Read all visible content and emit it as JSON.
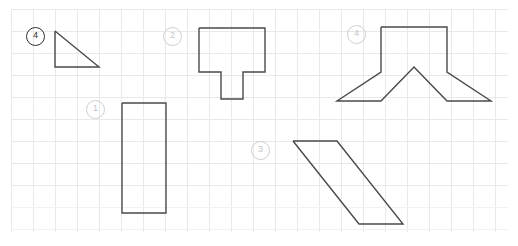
{
  "canvas": {
    "width": 518,
    "height": 246,
    "background_color": "#ffffff",
    "grid_color": "#e9e9ec",
    "grid_spacing": 22,
    "grid_origin_x": 11,
    "grid_origin_y": 9,
    "stroke_color": "#4a4a4a",
    "label_color": "#c3c3c8",
    "label_color_dark": "#2f2f2f"
  },
  "labels": [
    {
      "id": "callout-4-left",
      "text": "4",
      "x": 26,
      "y": 27,
      "style": "dark"
    },
    {
      "id": "callout-2",
      "text": "2",
      "x": 163,
      "y": 27,
      "style": "light"
    },
    {
      "id": "callout-1",
      "text": "1",
      "x": 86,
      "y": 100,
      "style": "light"
    },
    {
      "id": "callout-3",
      "text": "3",
      "x": 251,
      "y": 141,
      "style": "light"
    },
    {
      "id": "callout-4",
      "text": "4",
      "x": 347,
      "y": 25,
      "style": "light"
    }
  ],
  "shapes": [
    {
      "id": "shape-triangle",
      "name": "right-triangle",
      "points": "55,31 55,67 99,67 55,31"
    },
    {
      "id": "shape-rectangle",
      "name": "tall-rectangle",
      "points": "122,103 166,103 166,213 122,213 122,103"
    },
    {
      "id": "shape-tee",
      "name": "tee-polygon",
      "points": "199,28 265,28 265,72 243,72 243,99 221,99 221,72 199,72 199,28"
    },
    {
      "id": "shape-parallelogram",
      "name": "parallelogram",
      "points": "293,141 337,141 403,224 359,224 293,141"
    },
    {
      "id": "shape-arch",
      "name": "notched-trapezoid",
      "points": "381,27 447,27 447,72 491,101 447,101 414,67 381,101 337,101 381,72 381,27"
    }
  ]
}
